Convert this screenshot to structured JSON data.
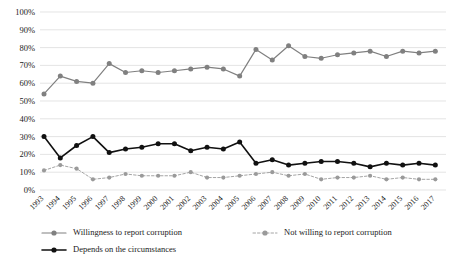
{
  "chart_data": {
    "type": "line",
    "title": "",
    "subtitle": "",
    "xlabel": "",
    "ylabel": "",
    "ylim": [
      0,
      100
    ],
    "ytick_labels": [
      "0%",
      "10%",
      "20%",
      "30%",
      "40%",
      "50%",
      "60%",
      "70%",
      "80%",
      "90%",
      "100%"
    ],
    "ytick_values": [
      0,
      10,
      20,
      30,
      40,
      50,
      60,
      70,
      80,
      90,
      100
    ],
    "grid": true,
    "legend_position": "bottom",
    "categories": [
      "1993",
      "1994",
      "1995",
      "1996",
      "1997",
      "1998",
      "1999",
      "2000",
      "2001",
      "2002",
      "2003",
      "2004",
      "2005",
      "2006",
      "2007",
      "2008",
      "2009",
      "2010",
      "2011",
      "2012",
      "2013",
      "2014",
      "2015",
      "2016",
      "2017"
    ],
    "series": [
      {
        "name": "Willingness to report corruption",
        "color": "#808080",
        "style": "solid",
        "values": [
          54,
          64,
          61,
          60,
          71,
          66,
          67,
          66,
          67,
          68,
          69,
          68,
          64,
          79,
          73,
          81,
          75,
          74,
          76,
          77,
          78,
          75,
          78,
          77,
          78
        ]
      },
      {
        "name": "Not willing to report corruption",
        "color": "#9a9a9a",
        "style": "dotted",
        "values": [
          11,
          14,
          12,
          6,
          7,
          9,
          8,
          8,
          8,
          10,
          7,
          7,
          8,
          9,
          10,
          8,
          9,
          6,
          7,
          7,
          8,
          6,
          7,
          6,
          6
        ]
      },
      {
        "name": "Depends on the circumstances",
        "color": "#111111",
        "style": "solid",
        "values": [
          30,
          18,
          25,
          30,
          21,
          23,
          24,
          26,
          26,
          22,
          24,
          23,
          27,
          15,
          17,
          14,
          15,
          16,
          16,
          15,
          13,
          15,
          14,
          15,
          14
        ]
      }
    ]
  },
  "legend": {
    "items": [
      {
        "label": "Willingness to report corruption"
      },
      {
        "label": "Not willing to report corruption"
      },
      {
        "label": "Depends on the circumstances"
      }
    ]
  }
}
